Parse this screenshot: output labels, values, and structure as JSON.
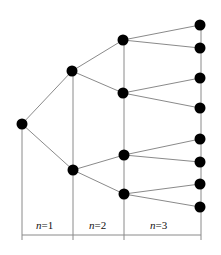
{
  "diagram": {
    "type": "binary-tree",
    "colors": {
      "node": "#000000",
      "edge": "#8a8a8a",
      "background": "#ffffff"
    },
    "node_radius": 5.5,
    "nodes": [
      {
        "id": "root",
        "x": 22,
        "y": 124
      },
      {
        "id": "n1a",
        "x": 72,
        "y": 71
      },
      {
        "id": "n1b",
        "x": 73,
        "y": 170
      },
      {
        "id": "n2a",
        "x": 123,
        "y": 40
      },
      {
        "id": "n2b",
        "x": 123,
        "y": 93
      },
      {
        "id": "n2c",
        "x": 124,
        "y": 155
      },
      {
        "id": "n2d",
        "x": 124,
        "y": 194
      },
      {
        "id": "l1",
        "x": 200,
        "y": 25
      },
      {
        "id": "l2",
        "x": 200,
        "y": 48
      },
      {
        "id": "l3",
        "x": 200,
        "y": 78
      },
      {
        "id": "l4",
        "x": 200,
        "y": 108
      },
      {
        "id": "l5",
        "x": 200,
        "y": 139
      },
      {
        "id": "l6",
        "x": 200,
        "y": 162
      },
      {
        "id": "l7",
        "x": 200,
        "y": 184
      },
      {
        "id": "l8",
        "x": 200,
        "y": 207
      }
    ],
    "edges": [
      [
        "root",
        "n1a"
      ],
      [
        "root",
        "n1b"
      ],
      [
        "n1a",
        "n2a"
      ],
      [
        "n1a",
        "n2b"
      ],
      [
        "n1b",
        "n2c"
      ],
      [
        "n1b",
        "n2d"
      ],
      [
        "n2a",
        "l1"
      ],
      [
        "n2a",
        "l2"
      ],
      [
        "n2b",
        "l3"
      ],
      [
        "n2b",
        "l4"
      ],
      [
        "n2c",
        "l5"
      ],
      [
        "n2c",
        "l6"
      ],
      [
        "n2d",
        "l7"
      ],
      [
        "n2d",
        "l8"
      ]
    ],
    "level_lines": [
      {
        "x": 22,
        "y1": 124,
        "y2": 240
      },
      {
        "x": 73,
        "y1": 71,
        "y2": 240
      },
      {
        "x": 124,
        "y1": 40,
        "y2": 240
      },
      {
        "x": 201,
        "y1": 25,
        "y2": 240
      }
    ],
    "baseline": {
      "x1": 22,
      "x2": 201,
      "y": 235
    },
    "labels": [
      {
        "var": "n",
        "rest": "=1",
        "x": 36,
        "y": 229
      },
      {
        "var": "n",
        "rest": "=2",
        "x": 89,
        "y": 229
      },
      {
        "var": "n",
        "rest": "=3",
        "x": 150,
        "y": 229
      }
    ]
  }
}
